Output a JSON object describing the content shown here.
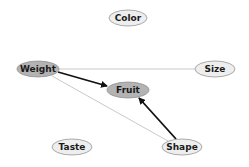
{
  "diagram": {
    "type": "directed-graph",
    "nodes": [
      {
        "id": "color",
        "label": "Color",
        "cx": 128,
        "cy": 18,
        "rx": 19,
        "ry": 8,
        "fill": "#eeeeee",
        "highlighted": false
      },
      {
        "id": "weight",
        "label": "Weight",
        "cx": 38,
        "cy": 69,
        "rx": 21,
        "ry": 8,
        "fill": "#b3b3b3",
        "highlighted": true
      },
      {
        "id": "size",
        "label": "Size",
        "cx": 215,
        "cy": 69,
        "rx": 20,
        "ry": 8,
        "fill": "#eeeeee",
        "highlighted": false
      },
      {
        "id": "fruit",
        "label": "Fruit",
        "cx": 128,
        "cy": 90,
        "rx": 21,
        "ry": 8,
        "fill": "#b3b3b3",
        "highlighted": true
      },
      {
        "id": "taste",
        "label": "Taste",
        "cx": 72,
        "cy": 147,
        "rx": 20,
        "ry": 8,
        "fill": "#eeeeee",
        "highlighted": false
      },
      {
        "id": "shape",
        "label": "Shape",
        "cx": 182,
        "cy": 147,
        "rx": 20,
        "ry": 8,
        "fill": "#eeeeee",
        "highlighted": false
      }
    ],
    "edges": [
      {
        "from": "weight",
        "to": "fruit",
        "directed": true,
        "weight": "strong",
        "color": "#111111"
      },
      {
        "from": "shape",
        "to": "fruit",
        "directed": true,
        "weight": "strong",
        "color": "#111111"
      },
      {
        "from": "weight",
        "to": "size",
        "directed": false,
        "weight": "weak",
        "color": "#bbbbbb"
      },
      {
        "from": "weight",
        "to": "shape",
        "directed": false,
        "weight": "weak",
        "color": "#bbbbbb"
      }
    ]
  },
  "colors": {
    "node_stroke": "#888888",
    "node_fill_default": "#eeeeee",
    "node_fill_highlight": "#b3b3b3",
    "strong_edge": "#111111",
    "weak_edge": "#bbbbbb"
  }
}
